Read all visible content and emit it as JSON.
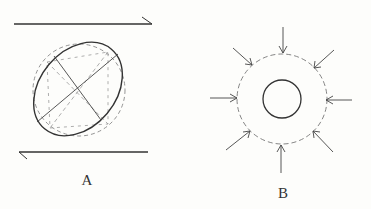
{
  "figure": {
    "panels": [
      {
        "id": "A",
        "label": "A",
        "description": "Simple shear: top plate moving right, bottom plate moving left; circle deforms into tilted ellipse",
        "top_arrow_direction": "right",
        "bottom_arrow_direction": "left"
      },
      {
        "id": "B",
        "label": "B",
        "description": "Uniform compression: eight inward arrows on dashed circle shrinking to smaller solid circle",
        "arrow_count": 8
      }
    ],
    "colors": {
      "ink": "#333333",
      "dashed": "#888888",
      "background": "#fdfdfb"
    }
  }
}
